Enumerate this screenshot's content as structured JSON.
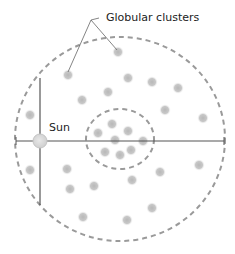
{
  "labels": {
    "globular_clusters": "Globular clusters",
    "sun": "Sun"
  },
  "colors": {
    "dash": "#999999",
    "line": "#555555",
    "cluster": "#bdbdbd",
    "sun": "#d6d6d6"
  },
  "galaxy": {
    "outer_halo": {
      "cx": 120,
      "cy": 139,
      "rx": 105,
      "ry": 102
    },
    "bulge": {
      "cx": 120,
      "cy": 139,
      "rx": 34,
      "ry": 30
    },
    "sun": {
      "cx": 40,
      "cy": 141,
      "r": 7
    }
  },
  "clusters": [
    [
      68,
      75
    ],
    [
      118,
      52
    ],
    [
      128,
      78
    ],
    [
      152,
      82
    ],
    [
      178,
      88
    ],
    [
      108,
      92
    ],
    [
      82,
      100
    ],
    [
      165,
      110
    ],
    [
      203,
      118
    ],
    [
      30,
      115
    ],
    [
      98,
      133
    ],
    [
      112,
      124
    ],
    [
      128,
      131
    ],
    [
      115,
      140
    ],
    [
      143,
      141
    ],
    [
      105,
      152
    ],
    [
      120,
      155
    ],
    [
      131,
      150
    ],
    [
      30,
      170
    ],
    [
      67,
      169
    ],
    [
      70,
      189
    ],
    [
      94,
      186
    ],
    [
      132,
      180
    ],
    [
      160,
      172
    ],
    [
      199,
      165
    ],
    [
      152,
      208
    ],
    [
      83,
      217
    ],
    [
      127,
      220
    ]
  ]
}
